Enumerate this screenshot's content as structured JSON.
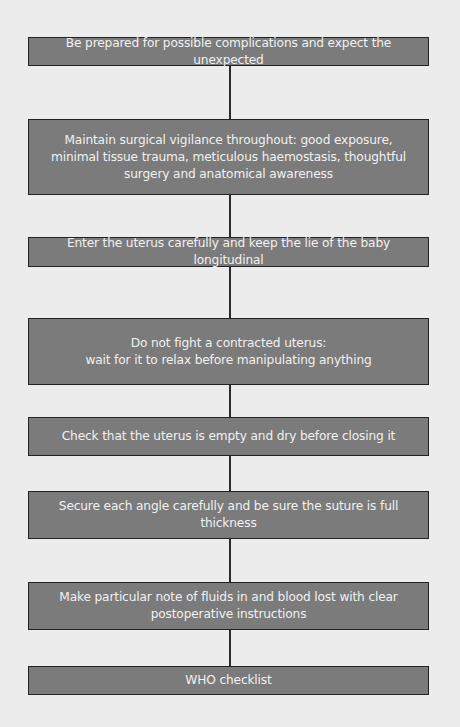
{
  "flowchart": {
    "title": "Caesarean section surgical principles",
    "colors": {
      "background": "#ececec",
      "box_fill": "#7b7b7b",
      "box_border": "#222222",
      "text": "#f1f1f1",
      "connector": "#2a2a2a"
    },
    "steps": [
      {
        "text": "Be prepared for possible complications and expect the unexpected"
      },
      {
        "text": "Maintain surgical vigilance throughout: good exposure,\nminimal tissue trauma, meticulous haemostasis, thoughtful\nsurgery and anatomical awareness"
      },
      {
        "text": "Enter the uterus carefully and keep the lie of the baby longitudinal"
      },
      {
        "text": "Do not fight a contracted uterus:\nwait for it to relax before manipulating anything"
      },
      {
        "text": "Check that the uterus is empty and dry before closing it"
      },
      {
        "text": "Secure each angle carefully and be sure the suture is full thickness"
      },
      {
        "text": "Make particular note of fluids in and blood lost with clear\npostoperative instructions"
      },
      {
        "text": "WHO checklist"
      }
    ]
  }
}
